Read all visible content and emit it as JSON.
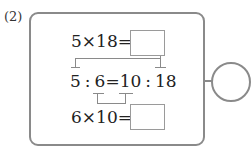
{
  "problem": {
    "label": "(2)",
    "row1": {
      "expression": "5×18=",
      "answer": ""
    },
    "row2": {
      "a": "5",
      "sep1": ":",
      "b": "6",
      "eq": "=",
      "c": "10",
      "sep2": ":",
      "d": "18"
    },
    "row3": {
      "expression": "6×10=",
      "answer": ""
    },
    "result_circle": {
      "answer": ""
    }
  },
  "colors": {
    "border": "#8a8a8a",
    "text": "#222222",
    "background": "#ffffff"
  }
}
